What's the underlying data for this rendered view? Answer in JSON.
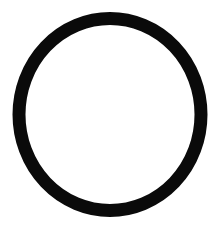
{
  "canvas": {
    "width": 221,
    "height": 229,
    "background": "#ffffff"
  },
  "shape": {
    "type": "ring",
    "description": "hand-drawn circle outline",
    "stroke_color": "#0a0a0a",
    "fill": "none",
    "cx": 110,
    "cy": 114.5,
    "rx": 91,
    "ry": 96,
    "stroke_width": 13
  }
}
